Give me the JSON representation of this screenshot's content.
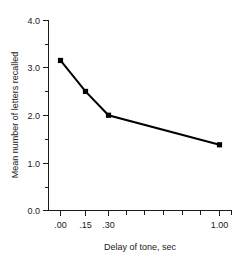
{
  "chart_data": {
    "type": "line",
    "title": "",
    "xlabel": "Delay of tone, sec",
    "ylabel": "Mean number of letters recalled",
    "x": [
      0.0,
      0.15,
      0.3,
      1.0
    ],
    "x_tick_labels": [
      ".00",
      ".15",
      ".30",
      "1.00"
    ],
    "values": [
      3.15,
      2.5,
      2.0,
      1.38
    ],
    "series": [
      {
        "name": "Mean number of letters recalled",
        "values": [
          3.15,
          2.5,
          2.0,
          1.38
        ]
      }
    ],
    "ylim": [
      0.0,
      4.0
    ],
    "y_tick_labels": [
      "0.0",
      "1.0",
      "2.0",
      "3.0",
      "4.0"
    ],
    "y_major_ticks": [
      0.0,
      1.0,
      2.0,
      3.0,
      4.0
    ],
    "y_minor_ticks": [
      0.5,
      1.5,
      2.5,
      3.5
    ],
    "x_minor_tick_count_after_30": 6,
    "grid": false,
    "legend": false,
    "legend_position": "none",
    "marker": "square",
    "line_color": "#000000",
    "marker_color": "#000000",
    "background_color": "#ffffff",
    "axis_color": "#1a1a1a"
  },
  "axes": {
    "y_title": "Mean number of letters recalled",
    "x_title": "Delay of tone, sec",
    "y_ticks": [
      {
        "label": "4.0",
        "value": 4.0
      },
      {
        "label": "3.0",
        "value": 3.0
      },
      {
        "label": "2.0",
        "value": 2.0
      },
      {
        "label": "1.0",
        "value": 1.0
      },
      {
        "label": "0.0",
        "value": 0.0
      }
    ],
    "x_ticks": [
      {
        "label": ".00",
        "value": 0.0
      },
      {
        "label": ".15",
        "value": 0.15
      },
      {
        "label": ".30",
        "value": 0.3
      },
      {
        "label": "1.00",
        "value": 1.0
      }
    ]
  }
}
